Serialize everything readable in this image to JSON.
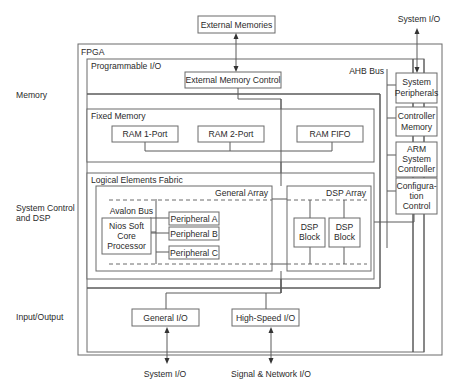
{
  "diagram": {
    "side_labels": {
      "memory": "Memory",
      "system_control_1": "System Control",
      "system_control_2": "and DSP",
      "input_output": "Input/Output"
    },
    "external": {
      "external_memories": "External Memories",
      "system_io_top": "System I/O",
      "system_io_bottom": "System I/O",
      "signal_network_io": "Signal & Network I/O"
    },
    "fpga": {
      "label": "FPGA",
      "programmable_io": {
        "label": "Programmable I/O",
        "external_memory_control": "External Memory Control",
        "general_io": "General I/O",
        "high_speed_io": "High-Speed I/O"
      },
      "fixed_memory": {
        "label": "Fixed Memory",
        "blocks": [
          "RAM 1-Port",
          "RAM 2-Port",
          "RAM FIFO"
        ]
      },
      "logical_elements_fabric": {
        "label": "Logical Elements Fabric",
        "general_array": {
          "label": "General Array",
          "avalon_bus": "Avalon Bus",
          "processor": [
            "Nios Soft",
            "Core",
            "Processor"
          ],
          "peripherals": [
            "Peripheral A",
            "Peripheral B",
            "Peripheral C"
          ]
        },
        "dsp_array": {
          "label": "DSP Array",
          "blocks": [
            [
              "DSP",
              "Block"
            ],
            [
              "DSP",
              "Block"
            ]
          ]
        }
      },
      "ahb": {
        "label": "AHB Bus",
        "system_peripherals": [
          "System",
          "Peripherals"
        ],
        "controller_memory": [
          "Controller",
          "Memory"
        ],
        "arm_controller": [
          "ARM",
          "System",
          "Controller"
        ],
        "configuration_control": [
          "Configura-",
          "tion",
          "Control"
        ]
      }
    }
  }
}
